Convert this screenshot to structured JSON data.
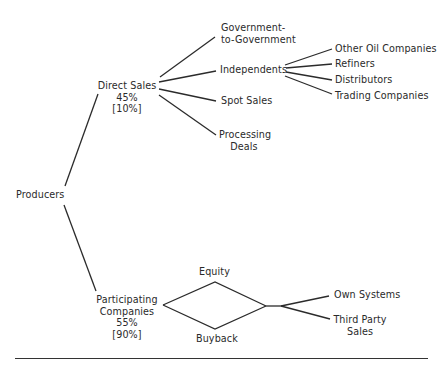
{
  "diagram": {
    "root": {
      "label": "Producers"
    },
    "direct_sales": {
      "label": "Direct Sales",
      "share": "45%",
      "bracket_share": "[10%]",
      "children": [
        {
          "label_line1": "Government-",
          "label_line2": "to-Government"
        },
        {
          "label": "Independents"
        },
        {
          "label": "Spot Sales"
        },
        {
          "label_line1": "Processing",
          "label_line2": "Deals"
        }
      ],
      "independents_children": [
        {
          "label": "Other Oil Companies"
        },
        {
          "label": "Refiners"
        },
        {
          "label": "Distributors"
        },
        {
          "label": "Trading Companies"
        }
      ]
    },
    "participating": {
      "label_line1": "Participating",
      "label_line2": "Companies",
      "share": "55%",
      "bracket_share": "[90%]",
      "routes": [
        {
          "label": "Equity"
        },
        {
          "label": "Buyback"
        }
      ],
      "destinations": [
        {
          "label": "Own Systems"
        },
        {
          "label_line1": "Third Party",
          "label_line2": "Sales"
        }
      ]
    }
  }
}
